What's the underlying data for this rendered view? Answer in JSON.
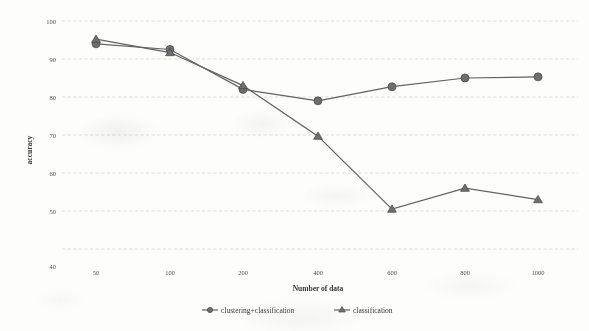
{
  "chart_data": {
    "type": "line",
    "title": "",
    "xlabel": "Number of data",
    "ylabel": "accuracy",
    "categories": [
      "50",
      "100",
      "200",
      "400",
      "600",
      "800",
      "1000"
    ],
    "ylim": [
      40,
      100
    ],
    "yticks": [
      "40",
      "50",
      "60",
      "70",
      "80",
      "90",
      "100"
    ],
    "grid": "horizontal-dashed",
    "legend_position": "bottom",
    "series": [
      {
        "name": "clustering+classification",
        "marker": "circle",
        "color": "#6a6a6a",
        "values": [
          94.0,
          92.5,
          82.0,
          79.0,
          82.7,
          85.0,
          85.3
        ]
      },
      {
        "name": "classification",
        "marker": "triangle",
        "color": "#6a6a6a",
        "values": [
          95.2,
          91.7,
          83.0,
          69.7,
          50.5,
          56.0,
          53.0
        ]
      }
    ]
  },
  "axes": {
    "y_title": "accuracy",
    "x_title": "Number of data",
    "y_tick_100": "100",
    "y_tick_90": "90",
    "y_tick_80": "80",
    "y_tick_70": "70",
    "y_tick_60": "60",
    "y_tick_50": "50",
    "y_tick_40": "40",
    "x_tick_0": "50",
    "x_tick_1": "100",
    "x_tick_2": "200",
    "x_tick_3": "400",
    "x_tick_4": "600",
    "x_tick_5": "800",
    "x_tick_6": "1000"
  },
  "legend": {
    "item_0": "clustering+classification",
    "item_1": "classification"
  }
}
